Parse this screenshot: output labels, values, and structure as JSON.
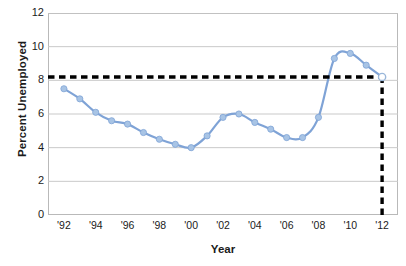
{
  "chart_data": {
    "type": "line",
    "title": "",
    "xlabel": "Year",
    "ylabel": "Percent Unemployed",
    "x": [
      1992,
      1993,
      1994,
      1995,
      1996,
      1997,
      1998,
      1999,
      2000,
      2001,
      2002,
      2003,
      2004,
      2005,
      2006,
      2007,
      2008,
      2009,
      2010,
      2011,
      2012
    ],
    "values": [
      7.5,
      6.9,
      6.1,
      5.6,
      5.4,
      4.9,
      4.5,
      4.2,
      4.0,
      4.7,
      5.8,
      6.0,
      5.5,
      5.1,
      4.6,
      4.6,
      5.8,
      9.3,
      9.6,
      8.9,
      8.2
    ],
    "x_tick_labels": [
      "'92",
      "'94",
      "'96",
      "'98",
      "'00",
      "'02",
      "'04",
      "'06",
      "'08",
      "'10",
      "'12"
    ],
    "x_tick_values": [
      1992,
      1994,
      1996,
      1998,
      2000,
      2002,
      2004,
      2006,
      2008,
      2010,
      2012
    ],
    "y_tick_labels": [
      "0",
      "2",
      "4",
      "6",
      "8",
      "10",
      "12"
    ],
    "y_tick_values": [
      0,
      2,
      4,
      6,
      8,
      10,
      12
    ],
    "xlim": [
      1991,
      2013
    ],
    "ylim": [
      0,
      12
    ],
    "grid": "horizontal",
    "legend": "none",
    "series_color": "#a8c4e5",
    "line_color": "#7fa3d6",
    "grid_color": "#c9c9c9",
    "frame_color": "#b9b9b9",
    "annotation_color": "#000000",
    "annotations": [
      {
        "name": "reference-line-horizontal",
        "style": "dashed",
        "orientation": "horizontal",
        "y": 8.2,
        "x_start": 1991,
        "x_end": 2012
      },
      {
        "name": "reference-line-vertical",
        "style": "dashed",
        "orientation": "vertical",
        "x": 2012,
        "y_start": 0,
        "y_end": 8.2
      }
    ],
    "highlight_point": {
      "name": "projected-2012-point",
      "x": 2012,
      "y": 8.2,
      "marker": "open-circle"
    }
  }
}
